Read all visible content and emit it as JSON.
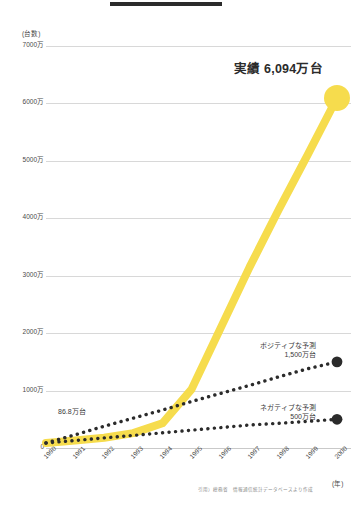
{
  "chart_data": {
    "type": "line",
    "title": "",
    "xlabel": "(年)",
    "ylabel": "(台数)",
    "ylim": [
      0,
      7000
    ],
    "yticks": [
      0,
      1000,
      2000,
      3000,
      4000,
      5000,
      6000,
      7000
    ],
    "ytick_labels": [
      "0",
      "1000万",
      "2000万",
      "3000万",
      "4000万",
      "5000万",
      "6000万",
      "7000万"
    ],
    "x": [
      1990,
      1991,
      1992,
      1993,
      1994,
      1995,
      1996,
      1997,
      1998,
      1999,
      2000
    ],
    "xtick_labels": [
      "1990",
      "1991",
      "1992",
      "1993",
      "1994",
      "1995",
      "1996",
      "1997",
      "1998",
      "1999",
      "2000"
    ],
    "grid": true,
    "legend": "none",
    "series": [
      {
        "name": "実績",
        "style": "solid-thick",
        "color": "#F6DC4D",
        "values": [
          86.8,
          130,
          180,
          260,
          430,
          1020,
          2088,
          3153,
          4153,
          5114,
          6094
        ],
        "end_marker": "circle",
        "end_label": "実績 6,094万台",
        "start_label": "86.8万台"
      },
      {
        "name": "ポジティブな予測",
        "style": "dotted",
        "color": "#2b2b2b",
        "values": [
          86.8,
          230,
          380,
          520,
          660,
          810,
          950,
          1090,
          1240,
          1380,
          1500
        ],
        "end_marker": "circle",
        "end_label": "ポジティブな予測 1,500万台"
      },
      {
        "name": "ネガティブな予測",
        "style": "dotted",
        "color": "#2b2b2b",
        "values": [
          86.8,
          130,
          175,
          220,
          265,
          310,
          355,
          400,
          430,
          465,
          500
        ],
        "end_marker": "circle",
        "end_label": "ネガティブな予測 500万台"
      }
    ],
    "annotations": [
      {
        "name": "actual-value",
        "text": "実績 6,094万台"
      },
      {
        "name": "positive-forecast",
        "line1": "ポジティブな予測",
        "line2": "1,500万台"
      },
      {
        "name": "negative-forecast",
        "line1": "ネガティブな予測",
        "line2": "500万台"
      },
      {
        "name": "start-value",
        "text": "86.8万台"
      }
    ],
    "source": "引用）総務省　情報通信統計データベースより作成"
  },
  "axes": {
    "y_unit": "(台数)",
    "x_unit": "(年)",
    "y_labels": [
      "7000万",
      "6000万",
      "5000万",
      "4000万",
      "3000万",
      "2000万",
      "1000万",
      "0"
    ],
    "x_labels": [
      "1990",
      "1991",
      "1992",
      "1993",
      "1994",
      "1995",
      "1996",
      "1997",
      "1998",
      "1999",
      "2000"
    ]
  },
  "annotations": {
    "actual": "実績 6,094万台",
    "positive_line1": "ポジティブな予測",
    "positive_line2": "1,500万台",
    "negative_line1": "ネガティブな予測",
    "negative_line2": "500万台",
    "start": "86.8万台"
  },
  "source": {
    "text": "引用）総務省　情報通信統計データベースより作成"
  },
  "colors": {
    "accent_yellow": "#F6DC4D",
    "dark": "#2b2b2b",
    "grid": "#d8d8d8"
  }
}
